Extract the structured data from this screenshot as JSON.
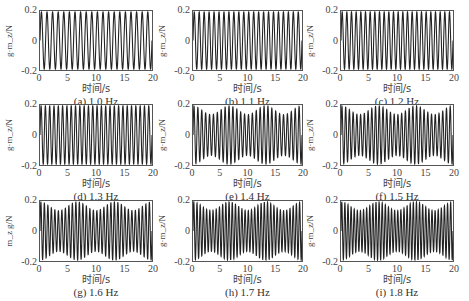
{
  "chart_data": [
    {
      "type": "line",
      "panel": "a",
      "caption": "(a) 1.0 Hz",
      "frequency_hz": 1.0,
      "amplitude": 0.2,
      "xlabel": "时间/s",
      "ylabel": "g·m_z/N",
      "xlim": [
        0,
        20
      ],
      "ylim": [
        -0.2,
        0.2
      ],
      "xticks": [
        "0",
        "5",
        "10",
        "15",
        "20"
      ],
      "yticks": [
        "0.2",
        "0",
        "-0.2"
      ],
      "grid": false
    },
    {
      "type": "line",
      "panel": "b",
      "caption": "(b) 1.1 Hz",
      "frequency_hz": 1.1,
      "amplitude": 0.2,
      "xlabel": "时间/s",
      "ylabel": "g·m_z/N",
      "xlim": [
        0,
        20
      ],
      "ylim": [
        -0.2,
        0.2
      ],
      "xticks": [
        "0",
        "5",
        "10",
        "15",
        "20"
      ],
      "yticks": [
        "0.2",
        "0",
        "-0.2"
      ],
      "grid": false
    },
    {
      "type": "line",
      "panel": "c",
      "caption": "(c) 1.2 Hz",
      "frequency_hz": 1.2,
      "amplitude": 0.2,
      "xlabel": "时间/s",
      "ylabel": "g·m_z/N",
      "xlim": [
        0,
        20
      ],
      "ylim": [
        -0.2,
        0.2
      ],
      "xticks": [
        "0",
        "5",
        "10",
        "15",
        "20"
      ],
      "yticks": [
        "0.2",
        "0",
        "-0.2"
      ],
      "grid": false
    },
    {
      "type": "line",
      "panel": "d",
      "caption": "(d) 1.3 Hz",
      "frequency_hz": 1.3,
      "amplitude": 0.2,
      "xlabel": "时间/s",
      "ylabel": "g·m_z/N",
      "xlim": [
        0,
        20
      ],
      "ylim": [
        -0.2,
        0.2
      ],
      "xticks": [
        "0",
        "5",
        "10",
        "15",
        "20"
      ],
      "yticks": [
        "0.2",
        "0",
        "-0.2"
      ],
      "grid": false
    },
    {
      "type": "line",
      "panel": "e",
      "caption": "(e) 1.4 Hz",
      "frequency_hz": 1.4,
      "amplitude": 0.2,
      "xlabel": "时间/s",
      "ylabel": "g·m_z/N",
      "xlim": [
        0,
        20
      ],
      "ylim": [
        -0.2,
        0.2
      ],
      "xticks": [
        "0",
        "5",
        "10",
        "15",
        "20"
      ],
      "yticks": [
        "0.2",
        "0",
        "-0.2"
      ],
      "grid": false
    },
    {
      "type": "line",
      "panel": "f",
      "caption": "(f) 1.5 Hz",
      "frequency_hz": 1.5,
      "amplitude": 0.2,
      "xlabel": "时间/s",
      "ylabel": "g·m_z/N",
      "xlim": [
        0,
        20
      ],
      "ylim": [
        -0.2,
        0.2
      ],
      "xticks": [
        "0",
        "5",
        "10",
        "15",
        "20"
      ],
      "yticks": [
        "0.2",
        "0",
        "-0.2"
      ],
      "grid": false
    },
    {
      "type": "line",
      "panel": "g",
      "caption": "(g) 1.6 Hz",
      "frequency_hz": 1.6,
      "amplitude": 0.2,
      "xlabel": "时间/s",
      "ylabel": "m_z g/N",
      "xlim": [
        0,
        20
      ],
      "ylim": [
        -0.2,
        0.2
      ],
      "xticks": [
        "0",
        "5",
        "10",
        "15",
        "20"
      ],
      "yticks": [
        "0.2",
        "0",
        "-0.2"
      ],
      "grid": false
    },
    {
      "type": "line",
      "panel": "h",
      "caption": "(h) 1.7 Hz",
      "frequency_hz": 1.7,
      "amplitude": 0.2,
      "xlabel": "时间/s",
      "ylabel": "g·m_z/N",
      "xlim": [
        0,
        20
      ],
      "ylim": [
        -0.2,
        0.2
      ],
      "xticks": [
        "0",
        "5",
        "10",
        "15",
        "20"
      ],
      "yticks": [
        "0.2",
        "0",
        "-0.2"
      ],
      "grid": false
    },
    {
      "type": "line",
      "panel": "i",
      "caption": "(i) 1.8 Hz",
      "frequency_hz": 1.8,
      "amplitude": 0.2,
      "xlabel": "时间/s",
      "ylabel": "g·m_z/N",
      "xlim": [
        0,
        20
      ],
      "ylim": [
        -0.2,
        0.2
      ],
      "xticks": [
        "0",
        "5",
        "10",
        "15",
        "20"
      ],
      "yticks": [
        "0.2",
        "0",
        "-0.2"
      ],
      "grid": false
    }
  ],
  "style": {
    "line_color": "#222222",
    "axis_color": "#555555"
  }
}
